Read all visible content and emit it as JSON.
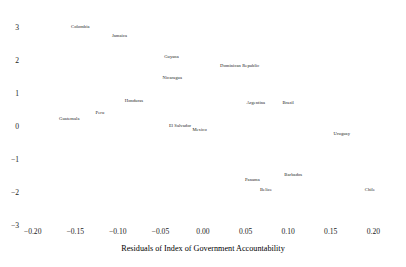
{
  "chart_data": {
    "type": "scatter",
    "title": "",
    "subtitle": "",
    "xlabel": "Residuals of Index of Government Accountability",
    "ylabel": "",
    "xlim": [
      -0.2125,
      0.2125
    ],
    "ylim": [
      -3.25,
      3.25
    ],
    "grid": false,
    "legend": null,
    "marker_style": "text-label-only",
    "xticks": [
      "−0.20",
      "−0.15",
      "−0.10",
      "−0.05",
      "0.00",
      "0.05",
      "0.10",
      "0.15",
      "0.20"
    ],
    "xtick_values": [
      -0.2,
      -0.15,
      -0.1,
      -0.05,
      0.0,
      0.05,
      0.1,
      0.15,
      0.2
    ],
    "yticks": [
      "3",
      "2",
      "1",
      "0",
      "−1",
      "−2",
      "−3"
    ],
    "ytick_values": [
      3,
      2,
      1,
      0,
      -1,
      -2,
      -3
    ],
    "points": [
      {
        "label": "Colombia",
        "x": -0.144,
        "y": 2.72
      },
      {
        "label": "Jamaica",
        "x": -0.098,
        "y": 2.47
      },
      {
        "label": "Guyana",
        "x": -0.037,
        "y": 1.81
      },
      {
        "label": "Dominican Republic",
        "x": 0.043,
        "y": 1.55
      },
      {
        "label": "Nicaragua",
        "x": -0.036,
        "y": 1.17
      },
      {
        "label": "Honduras",
        "x": -0.081,
        "y": 0.5
      },
      {
        "label": "Argentina",
        "x": 0.062,
        "y": 0.43
      },
      {
        "label": "Brazil",
        "x": 0.1,
        "y": 0.43
      },
      {
        "label": "Peru",
        "x": -0.121,
        "y": 0.13
      },
      {
        "label": "Guatemala",
        "x": -0.157,
        "y": -0.06
      },
      {
        "label": "El Salvador",
        "x": -0.027,
        "y": -0.28
      },
      {
        "label": "Mexico",
        "x": -0.004,
        "y": -0.4
      },
      {
        "label": "Uruguay",
        "x": 0.163,
        "y": -0.53
      },
      {
        "label": "Barbados",
        "x": 0.106,
        "y": -1.77
      },
      {
        "label": "Panama",
        "x": 0.058,
        "y": -1.9
      },
      {
        "label": "Belize",
        "x": 0.074,
        "y": -2.21
      },
      {
        "label": "Chile",
        "x": 0.196,
        "y": -2.23
      }
    ]
  }
}
